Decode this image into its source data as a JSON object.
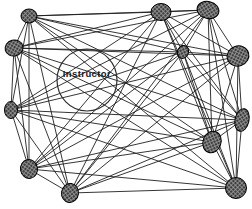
{
  "diagram": {
    "type": "sociogram-network",
    "title_label": "Instructor",
    "background": "#ffffff",
    "edge_color": "#1f1f1f",
    "edge_width": 0.9,
    "node_fill": "#3d3d3d",
    "node_hatch": "#9a9a9a",
    "node_stroke": "#000000",
    "instructor_ellipse": {
      "cx": 87,
      "cy": 80,
      "rx": 30,
      "ry": 31,
      "stroke": "#2e2e2e",
      "stroke_width": 1.2
    },
    "label_pos": {
      "x": 87,
      "y": 77
    },
    "nodes": [
      {
        "id": "n1",
        "x": 29,
        "y": 16,
        "rx": 8,
        "ry": 7,
        "rot": 0
      },
      {
        "id": "n2",
        "x": 14,
        "y": 48,
        "rx": 9,
        "ry": 8,
        "rot": -15
      },
      {
        "id": "n3",
        "x": 11,
        "y": 110,
        "rx": 6.5,
        "ry": 8.5,
        "rot": 0
      },
      {
        "id": "n4",
        "x": 29,
        "y": 169,
        "rx": 8.5,
        "ry": 9.5,
        "rot": -10
      },
      {
        "id": "n5",
        "x": 70,
        "y": 193,
        "rx": 8.5,
        "ry": 9.5,
        "rot": 8
      },
      {
        "id": "n6",
        "x": 161,
        "y": 12,
        "rx": 10,
        "ry": 8.5,
        "rot": 0
      },
      {
        "id": "n7",
        "x": 208,
        "y": 10,
        "rx": 11,
        "ry": 8.5,
        "rot": 12
      },
      {
        "id": "n8",
        "x": 238,
        "y": 56,
        "rx": 11,
        "ry": 10,
        "rot": -18
      },
      {
        "id": "n9",
        "x": 183,
        "y": 52,
        "rx": 5.5,
        "ry": 6.5,
        "rot": 20
      },
      {
        "id": "n10",
        "x": 242,
        "y": 120,
        "rx": 7,
        "ry": 11.5,
        "rot": 12
      },
      {
        "id": "n11",
        "x": 212,
        "y": 142,
        "rx": 9,
        "ry": 11,
        "rot": 20
      },
      {
        "id": "n12",
        "x": 236,
        "y": 188,
        "rx": 10.5,
        "ry": 10.5,
        "rot": 0
      }
    ],
    "edges": [
      [
        0,
        1
      ],
      [
        0,
        2
      ],
      [
        0,
        3
      ],
      [
        0,
        4
      ],
      [
        0,
        5
      ],
      [
        0,
        6
      ],
      [
        0,
        7
      ],
      [
        0,
        8
      ],
      [
        0,
        9
      ],
      [
        0,
        10
      ],
      [
        0,
        11
      ],
      [
        1,
        2
      ],
      [
        1,
        3
      ],
      [
        1,
        4
      ],
      [
        1,
        5
      ],
      [
        1,
        6
      ],
      [
        1,
        7
      ],
      [
        1,
        8
      ],
      [
        1,
        9
      ],
      [
        1,
        10
      ],
      [
        1,
        11
      ],
      [
        2,
        3
      ],
      [
        2,
        4
      ],
      [
        2,
        5
      ],
      [
        2,
        6
      ],
      [
        2,
        7
      ],
      [
        2,
        8
      ],
      [
        2,
        9
      ],
      [
        2,
        10
      ],
      [
        2,
        11
      ],
      [
        3,
        4
      ],
      [
        3,
        5
      ],
      [
        3,
        6
      ],
      [
        3,
        7
      ],
      [
        3,
        8
      ],
      [
        3,
        9
      ],
      [
        3,
        10
      ],
      [
        3,
        11
      ],
      [
        4,
        5
      ],
      [
        4,
        6
      ],
      [
        4,
        7
      ],
      [
        4,
        8
      ],
      [
        4,
        9
      ],
      [
        4,
        10
      ],
      [
        4,
        11
      ],
      [
        5,
        6
      ],
      [
        5,
        7
      ],
      [
        5,
        8
      ],
      [
        5,
        9
      ],
      [
        5,
        10
      ],
      [
        5,
        11
      ],
      [
        6,
        7
      ],
      [
        6,
        8
      ],
      [
        6,
        9
      ],
      [
        6,
        10
      ],
      [
        6,
        11
      ],
      [
        7,
        8
      ],
      [
        7,
        9
      ],
      [
        7,
        10
      ],
      [
        7,
        11
      ],
      [
        8,
        9
      ],
      [
        8,
        10
      ],
      [
        8,
        11
      ],
      [
        9,
        10
      ],
      [
        9,
        11
      ],
      [
        10,
        11
      ]
    ]
  }
}
